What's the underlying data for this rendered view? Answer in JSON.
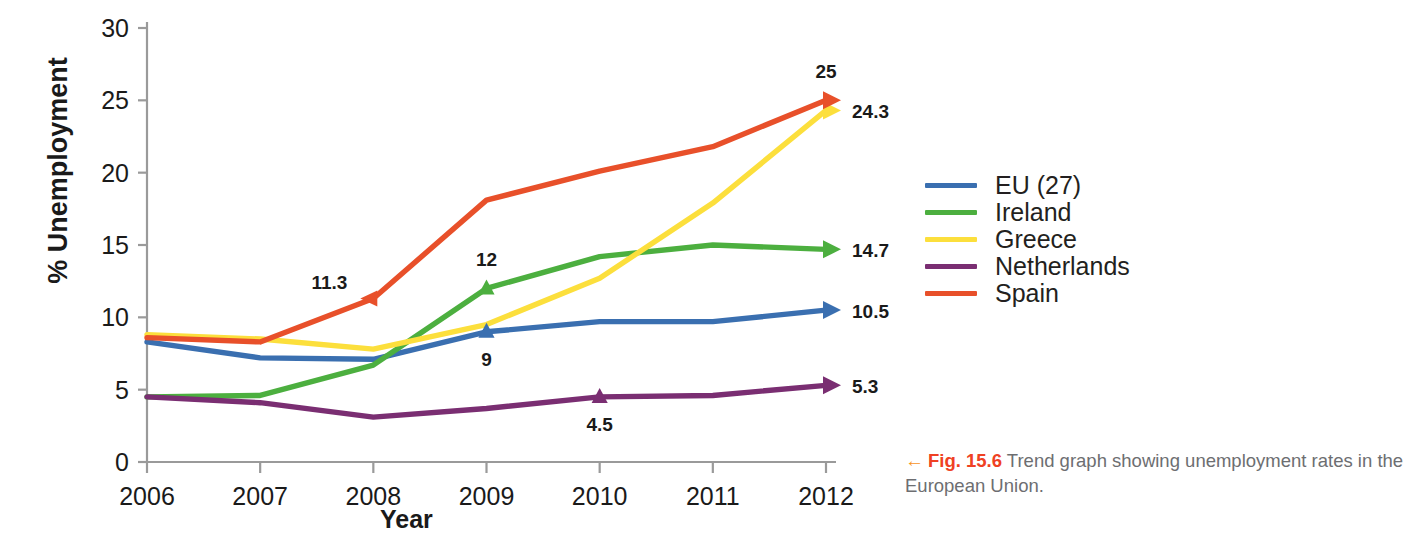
{
  "chart_data": {
    "type": "line",
    "title": "",
    "xlabel": "Year",
    "ylabel": "% Unemployment",
    "categories": [
      "2006",
      "2007",
      "2008",
      "2009",
      "2010",
      "2011",
      "2012"
    ],
    "x": [
      2006,
      2007,
      2008,
      2009,
      2010,
      2011,
      2012
    ],
    "xlim": [
      2006,
      2012
    ],
    "ylim": [
      0,
      30
    ],
    "yticks": [
      "0",
      "5",
      "10",
      "15",
      "20",
      "25",
      "30"
    ],
    "grid": false,
    "legend_position": "right",
    "series": [
      {
        "name": "EU (27)",
        "color": "#3A6FB0",
        "values": [
          8.3,
          7.2,
          7.1,
          9.0,
          9.7,
          9.7,
          10.5
        ],
        "end_label": "10.5",
        "point_labels": [
          {
            "x": 2009,
            "value": "9",
            "position": "below"
          }
        ]
      },
      {
        "name": "Ireland",
        "color": "#4CAF3F",
        "values": [
          4.5,
          4.6,
          6.7,
          12.0,
          14.2,
          15.0,
          14.7
        ],
        "end_label": "14.7",
        "point_labels": [
          {
            "x": 2009,
            "value": "12",
            "position": "above"
          }
        ]
      },
      {
        "name": "Greece",
        "color": "#FCDF3C",
        "values": [
          8.8,
          8.5,
          7.8,
          9.5,
          12.7,
          17.9,
          24.3
        ],
        "end_label": "24.3",
        "point_labels": []
      },
      {
        "name": "Netherlands",
        "color": "#7A2E72",
        "values": [
          4.5,
          4.1,
          3.1,
          3.7,
          4.5,
          4.6,
          5.3
        ],
        "end_label": "5.3",
        "point_labels": [
          {
            "x": 2010,
            "value": "4.5",
            "position": "below"
          }
        ]
      },
      {
        "name": "Spain",
        "color": "#E8502A",
        "values": [
          8.6,
          8.3,
          11.3,
          18.1,
          20.1,
          21.8,
          25.0
        ],
        "end_label": "25",
        "point_labels": [
          {
            "x": 2008,
            "value": "11.3",
            "position": "left"
          },
          {
            "x": 2012,
            "value": "25",
            "position": "above"
          }
        ]
      }
    ]
  },
  "caption": {
    "arrow": "←",
    "figure_number": "Fig. 15.6",
    "text": " Trend graph showing unemployment rates in the European Union.",
    "arrow_color": "#f7941e",
    "figno_color": "#ef4123"
  }
}
